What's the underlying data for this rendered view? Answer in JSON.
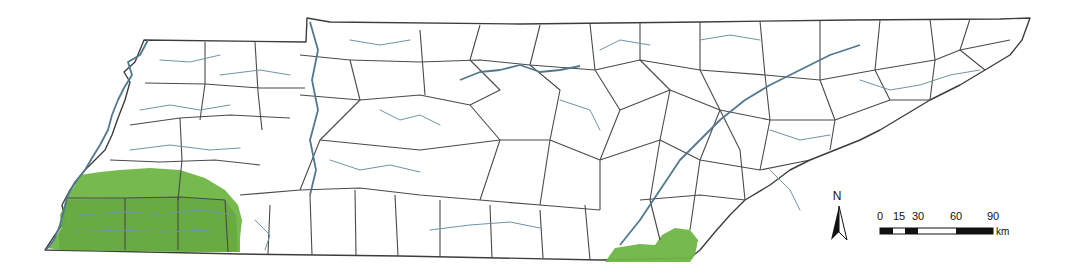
{
  "map": {
    "subject": "Tennessee counties with rivers",
    "highlight_color": "#6fb544",
    "highlight_regions": [
      {
        "name": "southwest-region",
        "description": "southwestern counties highlighted"
      },
      {
        "name": "southeast-region",
        "description": "southeastern border area highlighted"
      }
    ],
    "colors": {
      "county_border": "#4a4a4a",
      "river": "#6f93a8",
      "background": "#ffffff"
    }
  },
  "north_arrow": {
    "label": "N"
  },
  "scale_bar": {
    "ticks": [
      "0",
      "15",
      "30",
      "60",
      "90"
    ],
    "unit": "km"
  }
}
